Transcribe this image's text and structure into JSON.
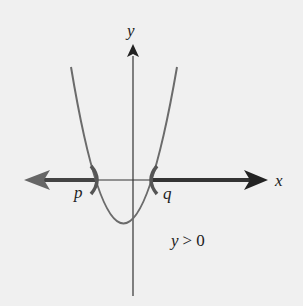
{
  "diagram": {
    "axes": {
      "x_label": "x",
      "y_label": "y"
    },
    "points": {
      "left_root": "p",
      "right_root": "q"
    },
    "condition": {
      "var": "y",
      "op": ">",
      "value": "0",
      "text": "y > 0"
    },
    "colors": {
      "axis": "#2a2a2a",
      "curve": "#6b6b6b",
      "highlight": "#3a3a3a",
      "background": "#f0f0f0"
    }
  }
}
